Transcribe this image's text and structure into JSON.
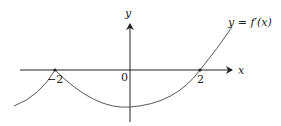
{
  "diagram": {
    "axis_labels": {
      "x": "x",
      "y": "y"
    },
    "tick_labels": {
      "neg2": "−2",
      "zero": "0",
      "pos2": "2"
    },
    "curve_label": "y = f′(x)",
    "colors": {
      "axis": "#222222",
      "curve": "#444444"
    }
  }
}
